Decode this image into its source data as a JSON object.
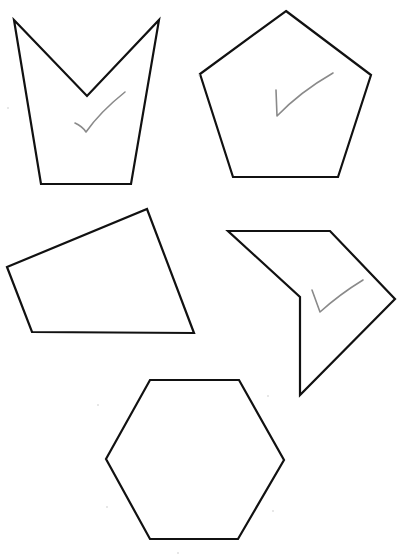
{
  "worksheet": {
    "background": "#ffffff",
    "stroke_color": "#111111",
    "check_color": "#8a8a8a",
    "shapes": [
      {
        "name": "concave-pentagon-top-left",
        "points": "14,20 87,96 159,20 131,184 41,184",
        "checked": true,
        "check_path": "M75,123 Q82,126 86,132 Q100,112 125,92"
      },
      {
        "name": "regular-pentagon-top-right",
        "points": "286,11 371,75 338,177 233,177 200,74",
        "checked": true,
        "check_path": "M276,90 L277,116 Q300,92 333,73"
      },
      {
        "name": "quadrilateral-middle-left",
        "points": "7,267 147,209 194,333 32,332",
        "checked": false,
        "check_path": ""
      },
      {
        "name": "concave-pentagon-middle-right",
        "points": "228,231 330,231 395,299 300,395 300,297",
        "checked": true,
        "check_path": "M312,290 L320,312 Q340,294 363,280"
      },
      {
        "name": "regular-hexagon-bottom",
        "points": "150,380 239,380 284,460 238,539 150,539 106,459",
        "checked": false,
        "check_path": ""
      }
    ]
  }
}
